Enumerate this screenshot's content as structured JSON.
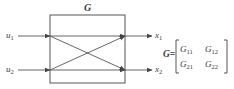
{
  "block": {
    "label": "G"
  },
  "inputs": [
    {
      "symbol": "u",
      "subscript": "1"
    },
    {
      "symbol": "u",
      "subscript": "2"
    }
  ],
  "outputs": [
    {
      "symbol": "x",
      "subscript": "1"
    },
    {
      "symbol": "x",
      "subscript": "2"
    }
  ],
  "matrix": {
    "lhs": "G=",
    "entries": [
      [
        {
          "symbol": "G",
          "subscript": "11"
        },
        {
          "symbol": "G",
          "subscript": "12"
        }
      ],
      [
        {
          "symbol": "G",
          "subscript": "21"
        },
        {
          "symbol": "G",
          "subscript": "22"
        }
      ]
    ]
  },
  "colors": {
    "line": "#555555",
    "text": "#3a3a3a",
    "background": "#ffffff"
  }
}
